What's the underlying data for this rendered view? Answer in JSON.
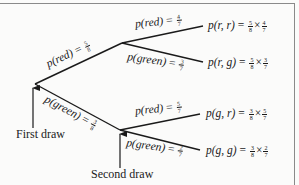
{
  "diagram": {
    "type": "probability-tree",
    "colors": {
      "line": "#1a1a1a",
      "background": "#fbfbfa",
      "frame": "#8a8a8a"
    },
    "first_branches": [
      {
        "label": "p(red)",
        "p_num": "5",
        "p_den": "8"
      },
      {
        "label": "p(green)",
        "p_num": "3",
        "p_den": "8"
      }
    ],
    "second_branches_after_red": [
      {
        "label": "p(red)",
        "p_num": "4",
        "p_den": "7"
      },
      {
        "label": "p(green)",
        "p_num": "3",
        "p_den": "7"
      }
    ],
    "second_branches_after_green": [
      {
        "label": "p(red)",
        "p_num": "5",
        "p_den": "7"
      },
      {
        "label": "p(green)",
        "p_num": "2",
        "p_den": "7"
      }
    ],
    "outcomes": [
      {
        "label": "p(r, r)",
        "a_num": "5",
        "a_den": "8",
        "b_num": "4",
        "b_den": "7"
      },
      {
        "label": "p(r, g)",
        "a_num": "5",
        "a_den": "8",
        "b_num": "3",
        "b_den": "7"
      },
      {
        "label": "p(g, r)",
        "a_num": "3",
        "a_den": "8",
        "b_num": "5",
        "b_den": "7"
      },
      {
        "label": "p(g, g)",
        "a_num": "3",
        "a_den": "8",
        "b_num": "2",
        "b_den": "7"
      }
    ],
    "annotations": {
      "first_draw": "First draw",
      "second_draw": "Second draw"
    },
    "symbols": {
      "equals": "=",
      "times": "×"
    }
  }
}
